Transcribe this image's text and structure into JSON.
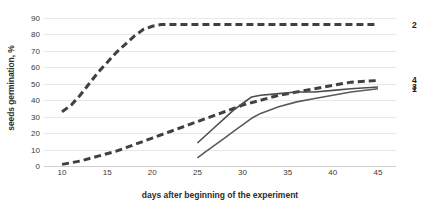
{
  "chart_data": {
    "type": "line",
    "title": "",
    "xlabel": "days after beginning of the experiment",
    "ylabel": "seeds germination, %",
    "xlim": [
      8,
      47
    ],
    "ylim": [
      0,
      90
    ],
    "xticks": [
      10,
      15,
      20,
      25,
      30,
      35,
      40,
      45
    ],
    "yticks": [
      0,
      10,
      20,
      30,
      40,
      50,
      60,
      70,
      80,
      90
    ],
    "grid": true,
    "legend_position": "right-of-plot-end-labels",
    "series": [
      {
        "name": "2",
        "label": "2",
        "style": "dashed",
        "color": "#404040",
        "x": [
          10,
          11,
          12,
          13,
          14,
          15,
          16,
          17,
          18,
          19,
          20,
          21,
          22,
          25,
          30,
          35,
          40,
          45
        ],
        "values": [
          33,
          37,
          43,
          50,
          57,
          63,
          69,
          74,
          79,
          83,
          85,
          86,
          86,
          86,
          86,
          86,
          86,
          86
        ]
      },
      {
        "name": "4",
        "label": "4",
        "style": "dashed",
        "color": "#404040",
        "x": [
          10,
          12,
          14,
          16,
          18,
          20,
          22,
          24,
          25,
          26,
          28,
          30,
          32,
          34,
          36,
          38,
          40,
          42,
          45
        ],
        "values": [
          1,
          3,
          6,
          9,
          13,
          17,
          21,
          25,
          27,
          29,
          33,
          37,
          40,
          43,
          45,
          47,
          49,
          51,
          52
        ]
      },
      {
        "name": "3",
        "label": "3",
        "style": "solid",
        "color": "#4d4d4d",
        "x": [
          25,
          26,
          27,
          28,
          29,
          30,
          31,
          32,
          34,
          36,
          38,
          40,
          42,
          45
        ],
        "values": [
          14,
          19,
          24,
          29,
          34,
          38,
          42,
          43,
          44,
          45,
          45,
          46,
          47,
          48
        ]
      },
      {
        "name": "1",
        "label": "1",
        "style": "solid",
        "color": "#5a5a5a",
        "x": [
          25,
          26,
          27,
          28,
          29,
          30,
          31,
          32,
          34,
          36,
          38,
          40,
          42,
          45
        ],
        "values": [
          5,
          9,
          13,
          17,
          21,
          25,
          29,
          32,
          36,
          39,
          41,
          43,
          45,
          47
        ]
      }
    ]
  },
  "axes": {
    "y_title": "seeds germination, %",
    "x_title": "days after beginning of the experiment",
    "y_tick_labels": [
      "90",
      "80",
      "70",
      "60",
      "50",
      "40",
      "30",
      "20",
      "10",
      "0"
    ],
    "x_tick_labels": [
      "10",
      "15",
      "20",
      "25",
      "30",
      "35",
      "40",
      "45"
    ]
  },
  "series_end_labels": [
    {
      "label": "2"
    },
    {
      "label": "4"
    },
    {
      "label": "3"
    },
    {
      "label": "1"
    }
  ],
  "colors": {
    "gridline": "#e8e8e8",
    "baseline": "#cfcfcf",
    "text": "#3a3a3a",
    "series_dark": "#404040"
  }
}
